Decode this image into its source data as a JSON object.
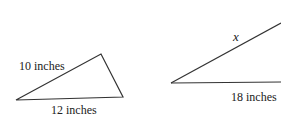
{
  "triangle_left": {
    "side_a_label": "10 inches",
    "side_b_label": "12 inches"
  },
  "triangle_right": {
    "side_a_label": "x",
    "side_b_label": "18 inches"
  },
  "colors": {
    "stroke": "#333333",
    "text": "#222222"
  }
}
